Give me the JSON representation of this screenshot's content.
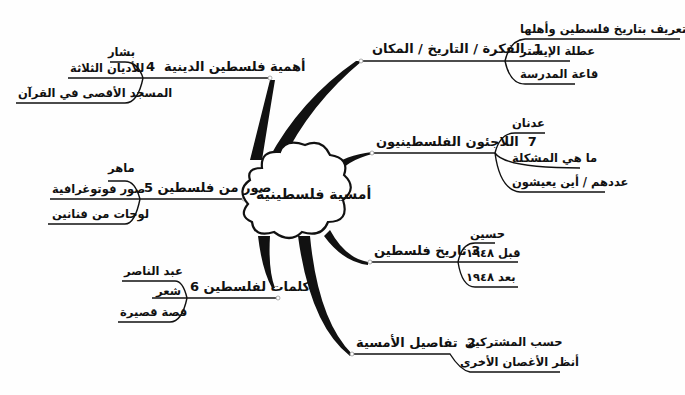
{
  "center": {
    "label": "أمسية فلسطينية"
  },
  "branches": [
    {
      "number": "1",
      "label": "الفكرة / التاريخ / المكان",
      "children": [
        "تعريف بتاريخ فلسطين وأهلها",
        "عطلة الإيستر",
        "قاعة المدرسة"
      ]
    },
    {
      "number": "7",
      "label": "اللاجئون الفلسطينيون",
      "children": [
        "عدنان",
        "ما هي المشكلة",
        "عددهم / أين يعيشون"
      ]
    },
    {
      "number": "3",
      "label": "تاريخ فلسطين",
      "children": [
        "حسين",
        "قبل ١٩٤٨",
        "بعد ١٩٤٨"
      ]
    },
    {
      "number": "2",
      "label": "تفاصيل الأمسية",
      "children": [
        "حسب المشتركين",
        "أنظر الأغصان الأخرى"
      ]
    },
    {
      "number": "4",
      "label": "أهمية فلسطين الدينية",
      "children": [
        "بشار",
        "للأديان الثلاثة",
        "المسجد الأقصى في القرآن"
      ]
    },
    {
      "number": "5",
      "label": "صور من فلسطين",
      "children": [
        "ماهر",
        "صور فوتوغرافية",
        "لوحات من فنانين"
      ]
    },
    {
      "number": "6",
      "label": "كلمات لفلسطين",
      "children": [
        "عبد الناصر",
        "شعر",
        "قصة قصيرة"
      ]
    }
  ],
  "colors": {
    "line": "#111111",
    "background": "#fefefe",
    "node_dot": "#bbbbbb"
  }
}
